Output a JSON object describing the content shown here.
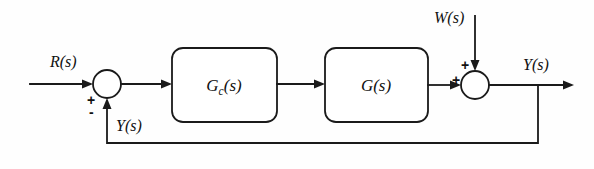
{
  "diagram": {
    "type": "control-system-block-diagram",
    "background_color": "#fefefe",
    "line_color": "#1a1a1a",
    "blocks": [
      {
        "id": "controller",
        "label_main": "G",
        "label_sub": "c",
        "label_tail": "(s)",
        "x": 172,
        "y": 48,
        "width": 105,
        "height": 74
      },
      {
        "id": "plant",
        "label_main": "G",
        "label_sub": "",
        "label_tail": "(s)",
        "x": 325,
        "y": 48,
        "width": 103,
        "height": 74
      }
    ],
    "summing_junctions": [
      {
        "id": "error-junction",
        "cx": 107,
        "cy": 84,
        "r": 14,
        "input_sign_left": "+",
        "input_sign_bottom": "-"
      },
      {
        "id": "disturbance-junction",
        "cx": 475,
        "cy": 85,
        "r": 14,
        "input_sign_left": "+",
        "input_sign_top": "+"
      }
    ],
    "signals": {
      "reference": "R(s)",
      "disturbance": "W(s)",
      "output": "Y(s)",
      "feedback": "Y(s)"
    }
  }
}
